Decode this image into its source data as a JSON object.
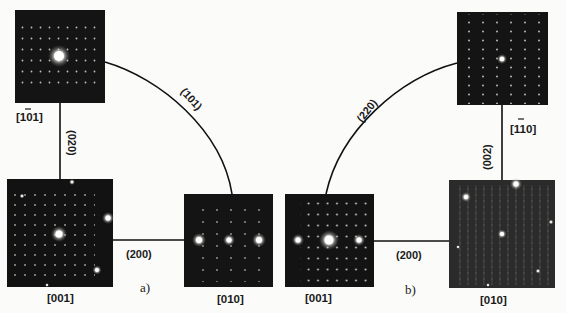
{
  "figure": {
    "subfigures": [
      {
        "id": "a",
        "label": "a)",
        "panels": [
          {
            "id": "a-top",
            "zone_axis": "[-101]",
            "zone_axis_display": "[101]",
            "overbar_digit": "1"
          },
          {
            "id": "a-bottom-left",
            "zone_axis": "[001]",
            "zone_axis_display": "[001]"
          },
          {
            "id": "a-bottom-right",
            "zone_axis": "[010]",
            "zone_axis_display": "[010]"
          }
        ],
        "connections": [
          {
            "from": "[-101]",
            "to": "[001]",
            "label": "(020)",
            "shape": "vertical-line"
          },
          {
            "from": "[001]",
            "to": "[010]",
            "label": "(200)",
            "shape": "horizontal-line"
          },
          {
            "from": "[-101]",
            "to": "[010]",
            "label": "(101)",
            "shape": "arc"
          }
        ]
      },
      {
        "id": "b",
        "label": "b)",
        "panels": [
          {
            "id": "b-top",
            "zone_axis": "[-110]",
            "zone_axis_display": "[110]",
            "overbar_digit": "1"
          },
          {
            "id": "b-bottom-left",
            "zone_axis": "[001]",
            "zone_axis_display": "[001]"
          },
          {
            "id": "b-bottom-right",
            "zone_axis": "[010]",
            "zone_axis_display": "[010]"
          }
        ],
        "connections": [
          {
            "from": "[-110]",
            "to": "[010]",
            "label": "(002)",
            "shape": "vertical-line"
          },
          {
            "from": "[001]",
            "to": "[010]",
            "label": "(200)",
            "shape": "horizontal-line"
          },
          {
            "from": "[001]",
            "to": "[-110]",
            "label": "(220)",
            "shape": "arc"
          }
        ]
      }
    ]
  },
  "labels": {
    "a_top": "[101]",
    "a_bl": "[001]",
    "a_br": "[010]",
    "a_020": "(020)",
    "a_200": "(200)",
    "a_101": "(101)",
    "a_sub": "a)",
    "b_top": "[110]",
    "b_bl": "[001]",
    "b_br": "[010]",
    "b_002": "(002)",
    "b_200": "(200)",
    "b_220": "(220)",
    "b_sub": "b)"
  },
  "colors": {
    "background": "#fbfbf9",
    "panel": "#141414",
    "panel_b_010": "#2b2b2b",
    "line": "#111111",
    "spot": "#f4f4f0"
  }
}
